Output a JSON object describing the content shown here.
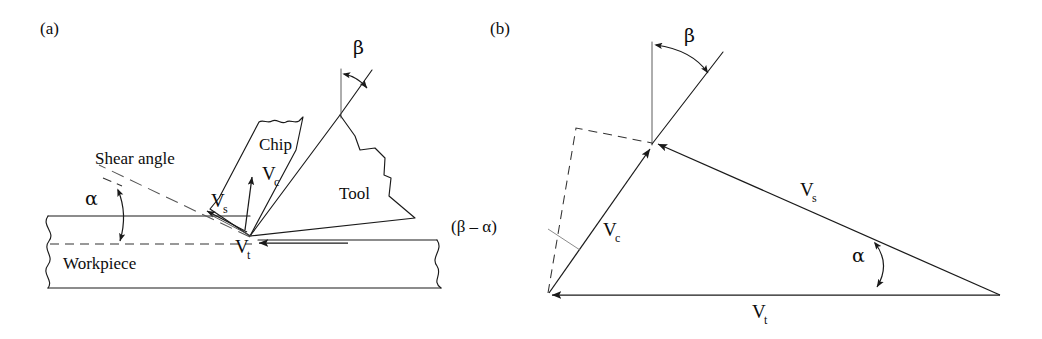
{
  "figure": {
    "panels": [
      {
        "id": "a",
        "tag": "(a)",
        "name": "orthogonal-cutting-geometry",
        "labels": {
          "shear_angle": "Shear angle",
          "alpha": "α",
          "beta": "β",
          "chip": "Chip",
          "tool": "Tool",
          "workpiece": "Workpiece",
          "v_chip": "V",
          "v_chip_sub": "c",
          "v_shear": "V",
          "v_shear_sub": "s",
          "v_tool": "V",
          "v_tool_sub": "t"
        }
      },
      {
        "id": "b",
        "tag": "(b)",
        "name": "velocity-triangle",
        "labels": {
          "beta": "β",
          "alpha": "α",
          "beta_minus_alpha": "(β – α)",
          "v_chip": "V",
          "v_chip_sub": "c",
          "v_shear": "V",
          "v_shear_sub": "s",
          "v_tool": "V",
          "v_tool_sub": "t"
        }
      }
    ],
    "colors": {
      "line": "#1a1a1a",
      "thin_line": "#4a4a4a",
      "dashed_line": "#333333",
      "leader": "#777777",
      "background": "#ffffff",
      "text": "#0d0d0d"
    }
  }
}
